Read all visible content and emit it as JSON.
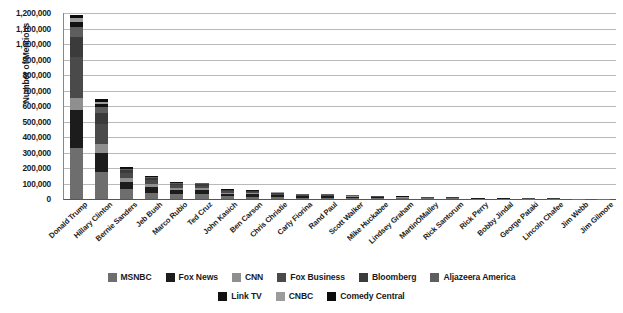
{
  "chart_data": {
    "type": "bar",
    "title": "",
    "xlabel": "",
    "ylabel": "Number of Mentions",
    "ylim": [
      0,
      1200000
    ],
    "ytick_step": 100000,
    "grid": true,
    "stacked": true,
    "legend_position": "bottom",
    "ytick_labels": [
      "1,200,000",
      "1,100,000",
      "1,000,000",
      "900,000",
      "800,000",
      "700,000",
      "600,000",
      "500,000",
      "400,000",
      "300,000",
      "200,000",
      "100,000",
      "0"
    ],
    "categories": [
      "Donald Trump",
      "Hillary Clinton",
      "Bernie Sanders",
      "Jeb Bush",
      "Marco Rubio",
      "Ted Cruz",
      "John Kasich",
      "Ben Carson",
      "Chris Christie",
      "Carly Fiorina",
      "Rand Paul",
      "Scott Walker",
      "Mike Huckabee",
      "Lindsey Graham",
      "MartinOMalley",
      "Rick Santorum",
      "Rick Perry",
      "Bobby Jindal",
      "George Pataki",
      "Lincoln Chafee",
      "Jim Webb",
      "Jim Gilmore"
    ],
    "series": [
      {
        "name": "MSNBC",
        "color": "#6e6e6e",
        "values": [
          330000,
          175000,
          62000,
          40000,
          32000,
          30000,
          18000,
          16000,
          12000,
          9000,
          9000,
          7000,
          6000,
          5000,
          5000,
          3500,
          2500,
          2000,
          1500,
          1200,
          1200,
          900
        ]
      },
      {
        "name": "Fox News",
        "color": "#1c1c1c",
        "values": [
          245000,
          120000,
          50000,
          38000,
          27000,
          28000,
          16000,
          15000,
          11000,
          8000,
          8000,
          6500,
          5500,
          4500,
          3000,
          3000,
          2200,
          1800,
          1300,
          1000,
          900,
          700
        ]
      },
      {
        "name": "CNN",
        "color": "#8f8f8f",
        "values": [
          80000,
          60000,
          25000,
          20000,
          14000,
          13000,
          8000,
          7000,
          5500,
          4000,
          4000,
          3000,
          2500,
          2200,
          1500,
          1500,
          1100,
          900,
          700,
          550,
          500,
          400
        ]
      },
      {
        "name": "Fox Business",
        "color": "#4a4a4a",
        "values": [
          260000,
          130000,
          30000,
          22000,
          17000,
          16000,
          9000,
          8500,
          6500,
          5000,
          4500,
          3500,
          3000,
          2500,
          1800,
          1700,
          1200,
          1000,
          800,
          600,
          550,
          420
        ]
      },
      {
        "name": "Bloomberg",
        "color": "#3b3b3b",
        "values": [
          130000,
          70000,
          18000,
          13000,
          10000,
          9500,
          5500,
          5000,
          4000,
          3000,
          2800,
          2200,
          1800,
          1500,
          1100,
          1000,
          800,
          650,
          500,
          400,
          350,
          280
        ]
      },
      {
        "name": "Aljazeera America",
        "color": "#5e5e5e",
        "values": [
          65000,
          40000,
          10000,
          7000,
          5500,
          5000,
          3000,
          2800,
          2200,
          1700,
          1500,
          1200,
          1000,
          800,
          600,
          550,
          450,
          350,
          280,
          220,
          200,
          160
        ]
      },
      {
        "name": "Link TV",
        "color": "#111111",
        "values": [
          35000,
          18000,
          5000,
          3000,
          2500,
          2200,
          1300,
          1200,
          900,
          700,
          650,
          500,
          420,
          350,
          260,
          240,
          190,
          150,
          120,
          95,
          85,
          70
        ]
      },
      {
        "name": "CNBC",
        "color": "#9c9c9c",
        "values": [
          25000,
          12000,
          3500,
          2000,
          1700,
          1500,
          900,
          800,
          600,
          470,
          430,
          340,
          280,
          230,
          170,
          160,
          130,
          100,
          80,
          65,
          55,
          45
        ]
      },
      {
        "name": "Comedy Central",
        "color": "#0c0c0c",
        "values": [
          15000,
          20000,
          1500,
          1000,
          800,
          700,
          400,
          380,
          290,
          220,
          200,
          160,
          130,
          110,
          80,
          75,
          60,
          48,
          38,
          30,
          26,
          22
        ]
      }
    ],
    "totals": [
      1185000,
      645000,
      205000,
      146000,
      110500,
      105900,
      62100,
      56680,
      42990,
      32090,
      31080,
      24400,
      20630,
      17190,
      13510,
      11725,
      8730,
      6998,
      5318,
      4160,
      3866,
      2997
    ]
  }
}
